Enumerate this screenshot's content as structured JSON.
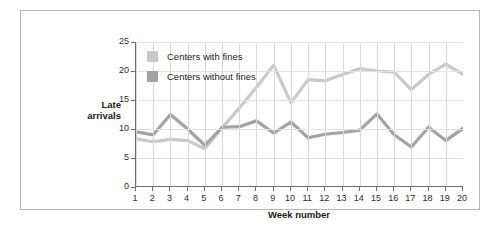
{
  "chart_data": {
    "type": "line",
    "title": "",
    "xlabel": "Week number",
    "ylabel": "Late arrivals",
    "ylabel_lines": [
      "Late",
      "arrivals"
    ],
    "x": [
      1,
      2,
      3,
      4,
      5,
      6,
      7,
      8,
      9,
      10,
      11,
      12,
      13,
      14,
      15,
      16,
      17,
      18,
      19,
      20
    ],
    "categories": [
      "1",
      "2",
      "3",
      "4",
      "5",
      "6",
      "7",
      "8",
      "9",
      "10",
      "11",
      "12",
      "13",
      "14",
      "15",
      "16",
      "17",
      "18",
      "19",
      "20"
    ],
    "xlim": [
      1,
      20
    ],
    "ylim": [
      0,
      25
    ],
    "yticks": [
      0,
      5,
      10,
      15,
      20,
      25
    ],
    "ytick_labels": [
      "0",
      "5",
      "10",
      "15",
      "20",
      "25"
    ],
    "grid": true,
    "legend_position": "top-left-inside",
    "series": [
      {
        "name": "Centers with fines",
        "color": "#c9c9c9",
        "values": [
          8.3,
          7.8,
          8.2,
          8.0,
          6.6,
          10.2,
          13.6,
          17.2,
          21.0,
          14.5,
          18.5,
          18.3,
          19.4,
          20.4,
          20.0,
          19.8,
          16.8,
          19.4,
          21.2,
          19.4
        ]
      },
      {
        "name": "Centers without fines",
        "color": "#a3a3a3",
        "values": [
          9.5,
          9.0,
          12.5,
          10.0,
          7.2,
          10.3,
          10.4,
          11.4,
          9.3,
          11.2,
          8.5,
          9.1,
          9.4,
          9.8,
          12.6,
          9.0,
          6.9,
          10.3,
          8.0,
          10.1
        ]
      }
    ]
  },
  "legend": {
    "items": [
      {
        "label": "Centers with fines",
        "color": "#c9c9c9"
      },
      {
        "label": "Centers without fines",
        "color": "#a3a3a3"
      }
    ]
  },
  "axes": {
    "x_title": "Week number",
    "y_title_line1": "Late",
    "y_title_line2": "arrivals"
  },
  "colors": {
    "series_light": "#c9c9c9",
    "series_dark": "#a3a3a3",
    "axis": "#6e6e6e",
    "grid": "#d9d9d9",
    "frame": "#b4b4b4",
    "text": "#1a1a1a"
  }
}
